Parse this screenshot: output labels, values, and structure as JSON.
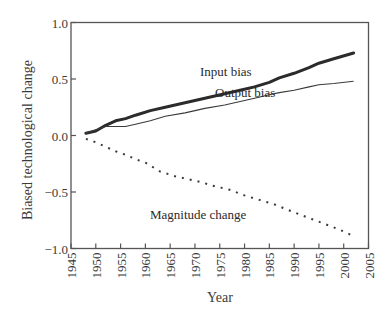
{
  "chart_data": {
    "type": "line",
    "title": "",
    "xlabel": "Year",
    "ylabel": "Biased technological change",
    "xlim": [
      1945,
      2005
    ],
    "ylim": [
      -1.0,
      1.0
    ],
    "grid": false,
    "legend": "inline labels",
    "xticks": [
      "1945",
      "1950",
      "1955",
      "1960",
      "1965",
      "1970",
      "1975",
      "1980",
      "1985",
      "1990",
      "1995",
      "2000",
      "2005"
    ],
    "yticks": [
      "1.0",
      "0.5",
      "0.0",
      "−0.5",
      "−1.0"
    ],
    "series": [
      {
        "name": "Input bias",
        "style": "thick solid",
        "x": [
          1948,
          1950,
          1952,
          1954,
          1956,
          1958,
          1961,
          1964,
          1968,
          1972,
          1976,
          1980,
          1982,
          1985,
          1987,
          1990,
          1993,
          1995,
          1998,
          2002
        ],
        "values": [
          0.02,
          0.04,
          0.09,
          0.13,
          0.15,
          0.18,
          0.22,
          0.25,
          0.29,
          0.33,
          0.37,
          0.41,
          0.43,
          0.47,
          0.51,
          0.55,
          0.6,
          0.64,
          0.68,
          0.73
        ]
      },
      {
        "name": "Output bias",
        "style": "thin solid",
        "x": [
          1948,
          1950,
          1952,
          1954,
          1956,
          1958,
          1961,
          1964,
          1968,
          1972,
          1976,
          1980,
          1982,
          1985,
          1987,
          1990,
          1993,
          1995,
          1998,
          2002
        ],
        "values": [
          0.02,
          0.05,
          0.08,
          0.08,
          0.08,
          0.1,
          0.13,
          0.17,
          0.2,
          0.24,
          0.27,
          0.31,
          0.33,
          0.36,
          0.38,
          0.4,
          0.43,
          0.45,
          0.46,
          0.48
        ]
      },
      {
        "name": "Magnitude change",
        "style": "dotted",
        "x": [
          1948,
          1950,
          1952,
          1954,
          1956,
          1958,
          1960,
          1963,
          1966,
          1968,
          1971,
          1974,
          1977,
          1980,
          1983,
          1986,
          1990,
          1993,
          1996,
          1999,
          2002
        ],
        "values": [
          -0.03,
          -0.06,
          -0.1,
          -0.14,
          -0.17,
          -0.21,
          -0.24,
          -0.32,
          -0.36,
          -0.38,
          -0.41,
          -0.45,
          -0.48,
          -0.53,
          -0.57,
          -0.61,
          -0.68,
          -0.73,
          -0.78,
          -0.83,
          -0.89
        ]
      }
    ],
    "annotations": [
      {
        "text": "Input bias",
        "x": 1971,
        "y": 0.56
      },
      {
        "text": "Output bias",
        "x": 1974,
        "y": 0.37
      },
      {
        "text": "Magnitude change",
        "x": 1961,
        "y": -0.72
      }
    ]
  },
  "labels": {
    "xlabel": "Year",
    "ylabel": "Biased technological change",
    "input_bias": "Input bias",
    "output_bias": "Output bias",
    "magnitude_change": "Magnitude change"
  }
}
